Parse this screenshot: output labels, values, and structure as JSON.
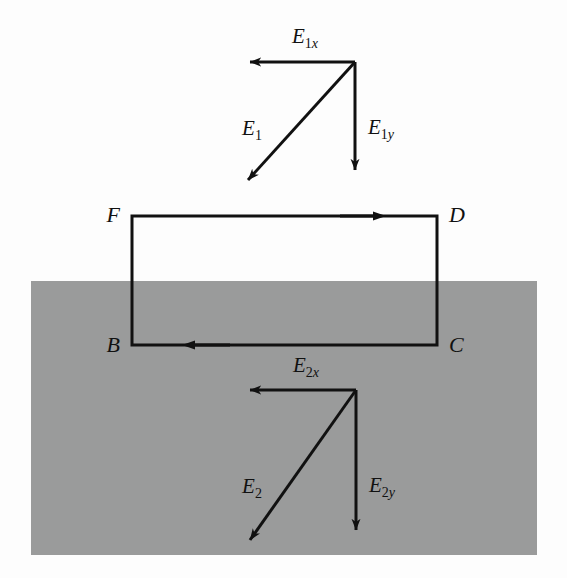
{
  "figure": {
    "background_color": "#fdfdfd",
    "medium_color": "#9a9b9b"
  },
  "medium_region": {
    "name": "dielectric-region",
    "x": 31,
    "y": 281,
    "width": 506,
    "height": 274
  },
  "loop": {
    "name": "closed-loop-FDCB",
    "left": 132,
    "top": 216,
    "right": 437,
    "bottom": 345,
    "corners": [
      {
        "id": "F",
        "label": "F",
        "x": 120,
        "y": 222,
        "anchor": "end"
      },
      {
        "id": "D",
        "label": "D",
        "x": 449,
        "y": 222,
        "anchor": "start"
      },
      {
        "id": "C",
        "label": "C",
        "x": 449,
        "y": 352,
        "anchor": "start"
      },
      {
        "id": "B",
        "label": "B",
        "x": 120,
        "y": 352,
        "anchor": "end"
      }
    ],
    "direction_markers": [
      {
        "name": "loop-arrow-top",
        "x": 378,
        "y": 216,
        "direction": "right"
      },
      {
        "name": "loop-arrow-bottom",
        "x": 190,
        "y": 345,
        "direction": "left"
      }
    ]
  },
  "vectors_upper": {
    "group_name": "field-vectors-above-boundary",
    "origin": {
      "x": 355,
      "y": 62
    },
    "items": [
      {
        "name": "vector-E1x",
        "base": "E",
        "sub": "1x",
        "sub_num": "1",
        "sub_italic": "x",
        "x1": 355,
        "y1": 62,
        "x2": 250,
        "y2": 62,
        "label_x": 305,
        "label_y": 43
      },
      {
        "name": "vector-E1y",
        "base": "E",
        "sub": "1y",
        "sub_num": "1",
        "sub_italic": "y",
        "x1": 355,
        "y1": 62,
        "x2": 355,
        "y2": 170,
        "label_x": 368,
        "label_y": 134
      },
      {
        "name": "vector-E1",
        "base": "E",
        "sub": "1",
        "sub_num": "1",
        "sub_italic": "",
        "x1": 355,
        "y1": 62,
        "x2": 248,
        "y2": 180,
        "label_x": 252,
        "label_y": 135
      }
    ]
  },
  "vectors_lower": {
    "group_name": "field-vectors-below-boundary",
    "origin": {
      "x": 356,
      "y": 390
    },
    "items": [
      {
        "name": "vector-E2x",
        "base": "E",
        "sub": "2x",
        "sub_num": "2",
        "sub_italic": "x",
        "x1": 356,
        "y1": 390,
        "x2": 250,
        "y2": 390,
        "label_x": 306,
        "label_y": 372
      },
      {
        "name": "vector-E2y",
        "base": "E",
        "sub": "2y",
        "sub_num": "2",
        "sub_italic": "y",
        "x1": 356,
        "y1": 390,
        "x2": 356,
        "y2": 530,
        "label_x": 369,
        "label_y": 492
      },
      {
        "name": "vector-E2",
        "base": "E",
        "sub": "2",
        "sub_num": "2",
        "sub_italic": "",
        "x1": 356,
        "y1": 390,
        "x2": 250,
        "y2": 540,
        "label_x": 252,
        "label_y": 493
      }
    ]
  }
}
